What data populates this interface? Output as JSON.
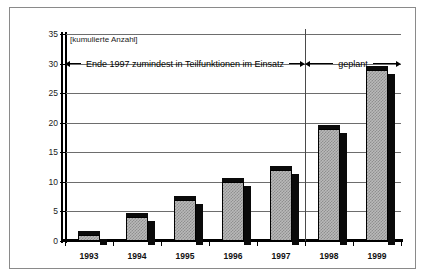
{
  "chart_data": {
    "type": "bar",
    "title": "",
    "subtitle": "",
    "axis_caption": "[kumulierte Anzahl]",
    "xlabel": "",
    "ylabel": "",
    "categories": [
      "1993",
      "1994",
      "1995",
      "1996",
      "1997",
      "1998",
      "1999"
    ],
    "values": [
      1,
      4,
      7,
      10,
      12,
      19,
      29
    ],
    "series": [
      {
        "name": "kumulierte Anzahl",
        "values": [
          1,
          4,
          7,
          10,
          12,
          19,
          29
        ]
      }
    ],
    "ylim": [
      0,
      35
    ],
    "ytick_values": [
      0,
      5,
      10,
      15,
      20,
      25,
      30,
      35
    ],
    "ytick_labels": [
      "0",
      "5",
      "10",
      "15",
      "20",
      "25",
      "30",
      "35"
    ],
    "ytick_step": 5,
    "grid": true,
    "grid_axis": "y",
    "legend": false,
    "legend_position": "none",
    "annotations": [
      {
        "id": "einsatz",
        "text": "Ende 1997 zumindest in Teilfunktionen im Einsatz",
        "arrow_start": true,
        "arrow_end": true,
        "spans_categories": [
          "1993",
          "1997"
        ],
        "at_value": 30
      },
      {
        "id": "geplant",
        "text": "geplant",
        "arrow_start": true,
        "arrow_end": true,
        "spans_categories": [
          "1998",
          "1999"
        ],
        "at_value": 30
      }
    ],
    "divider": {
      "between": [
        "1997",
        "1998"
      ],
      "label": "Trennlinie Ist / Plan"
    },
    "colors": {
      "bar_fill": "#b9b9b9",
      "bar_pattern": "#8f8f8f",
      "bar_outline": "#000000",
      "bar_shadow": "#0a0a0a",
      "gridline": "#6d6d6d",
      "axis": "#000000",
      "frame": "#8a8a8a",
      "background": "#ffffff",
      "text": "#111111"
    }
  }
}
